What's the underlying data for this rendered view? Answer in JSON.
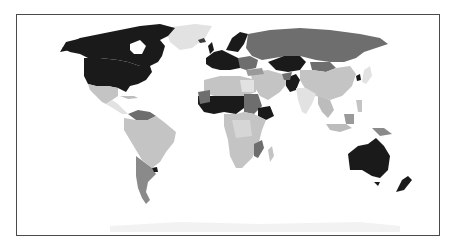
{
  "map": {
    "type": "choropleth",
    "projection": "equirectangular-like world map",
    "color_scheme": "grayscale",
    "legend": null,
    "title": null,
    "colors": {
      "ocean": "#ffffff",
      "border": "#4a4a4a",
      "very_dark": "#1a1a1a",
      "dark": "#6e6e6e",
      "medium": "#9a9a9a",
      "light": "#c4c4c4",
      "very_light": "#e2e2e2"
    },
    "regions": [
      {
        "name": "Canada",
        "shade": "very_dark"
      },
      {
        "name": "United States",
        "shade": "very_dark"
      },
      {
        "name": "Greenland",
        "shade": "very_light"
      },
      {
        "name": "Mexico",
        "shade": "light"
      },
      {
        "name": "Central America & Caribbean",
        "shade": "very_light"
      },
      {
        "name": "Venezuela/Guyana region",
        "shade": "dark"
      },
      {
        "name": "Brazil & northern South America",
        "shade": "light"
      },
      {
        "name": "Argentina",
        "shade": "dark"
      },
      {
        "name": "Uruguay",
        "shade": "very_dark"
      },
      {
        "name": "Western Europe",
        "shade": "very_dark"
      },
      {
        "name": "Scandinavia",
        "shade": "very_dark"
      },
      {
        "name": "Russia",
        "shade": "dark"
      },
      {
        "name": "Kazakhstan",
        "shade": "very_dark"
      },
      {
        "name": "Mongolia",
        "shade": "dark"
      },
      {
        "name": "China",
        "shade": "light"
      },
      {
        "name": "Pakistan",
        "shade": "very_dark"
      },
      {
        "name": "India",
        "shade": "very_light"
      },
      {
        "name": "Middle East",
        "shade": "light"
      },
      {
        "name": "North Africa",
        "shade": "light"
      },
      {
        "name": "West Africa / Sahel",
        "shade": "very_dark"
      },
      {
        "name": "Sudan",
        "shade": "dark"
      },
      {
        "name": "Ethiopia",
        "shade": "very_dark"
      },
      {
        "name": "Central & Southern Africa",
        "shade": "light"
      },
      {
        "name": "Mozambique",
        "shade": "dark"
      },
      {
        "name": "Madagascar",
        "shade": "light"
      },
      {
        "name": "Southeast Asia",
        "shade": "light"
      },
      {
        "name": "Japan",
        "shade": "very_light"
      },
      {
        "name": "North Korea",
        "shade": "very_dark"
      },
      {
        "name": "Papua New Guinea",
        "shade": "dark"
      },
      {
        "name": "Australia",
        "shade": "very_dark"
      },
      {
        "name": "New Zealand",
        "shade": "very_dark"
      },
      {
        "name": "Antarctica",
        "shade": "very_light"
      }
    ]
  }
}
